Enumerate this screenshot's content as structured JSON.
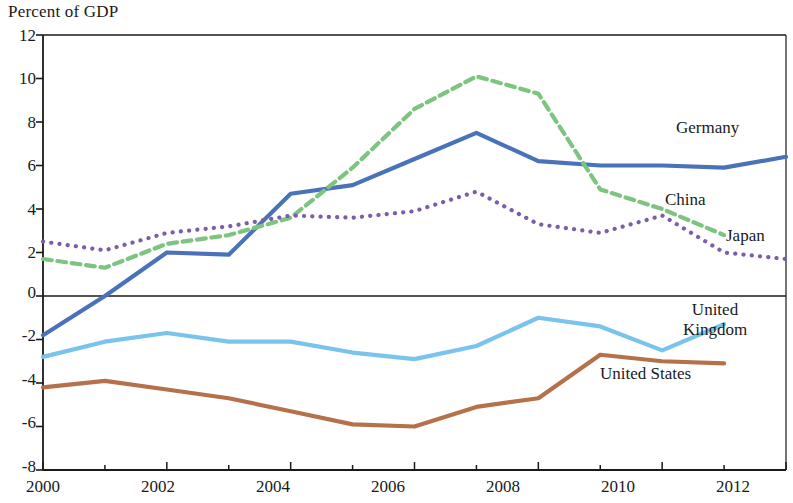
{
  "chart_data": {
    "type": "line",
    "title": "Percent of GDP",
    "xlabel": "",
    "ylabel": "Percent of GDP",
    "x": [
      2000,
      2001,
      2002,
      2003,
      2004,
      2005,
      2006,
      2007,
      2008,
      2009,
      2010,
      2011,
      2012
    ],
    "xlim": [
      2000,
      2012
    ],
    "ylim": [
      -8,
      12
    ],
    "ytick_labels": [
      "12",
      "10",
      "8",
      "6",
      "4",
      "2",
      "0",
      "-2",
      "-4",
      "-6",
      "-8"
    ],
    "yticks": [
      12,
      10,
      8,
      6,
      4,
      2,
      0,
      -2,
      -4,
      -6,
      -8
    ],
    "xtick_labels": [
      "2000",
      "2002",
      "2004",
      "2006",
      "2008",
      "2010",
      "2012"
    ],
    "xticks": [
      2000,
      2002,
      2004,
      2006,
      2008,
      2010,
      2012
    ],
    "xminor_ticks": [
      2001,
      2003,
      2005,
      2007,
      2009,
      2011
    ],
    "grid": false,
    "zero_line": true,
    "legend_position": "inline-right",
    "series": [
      {
        "name": "Germany",
        "color": "#4a72b8",
        "style": "solid",
        "x": [
          2000,
          2001,
          2002,
          2003,
          2004,
          2005,
          2006,
          2007,
          2008,
          2009,
          2010,
          2011,
          2012
        ],
        "values": [
          -1.8,
          0.0,
          2.0,
          1.9,
          4.7,
          5.1,
          6.3,
          7.5,
          6.2,
          6.0,
          6.0,
          5.9,
          6.4
        ]
      },
      {
        "name": "China",
        "color": "#7cc47f",
        "style": "dashed",
        "x": [
          2000,
          2001,
          2002,
          2003,
          2004,
          2005,
          2006,
          2007,
          2008,
          2009,
          2010,
          2011
        ],
        "values": [
          1.7,
          1.3,
          2.4,
          2.8,
          3.6,
          5.9,
          8.6,
          10.1,
          9.3,
          4.9,
          4.0,
          2.8
        ]
      },
      {
        "name": "Japan",
        "color": "#7b5ea7",
        "style": "dotted",
        "x": [
          2000,
          2001,
          2002,
          2003,
          2004,
          2005,
          2006,
          2007,
          2008,
          2009,
          2010,
          2011,
          2012
        ],
        "values": [
          2.5,
          2.1,
          2.9,
          3.2,
          3.7,
          3.6,
          3.9,
          4.8,
          3.3,
          2.9,
          3.7,
          2.0,
          1.7
        ]
      },
      {
        "name": "United Kingdom",
        "color": "#79c3ec",
        "style": "solid",
        "x": [
          2000,
          2001,
          2002,
          2003,
          2004,
          2005,
          2006,
          2007,
          2008,
          2009,
          2010,
          2011
        ],
        "values": [
          -2.8,
          -2.1,
          -1.7,
          -2.1,
          -2.1,
          -2.6,
          -2.9,
          -2.3,
          -1.0,
          -1.4,
          -2.5,
          -1.3
        ]
      },
      {
        "name": "United States",
        "color": "#b5714a",
        "style": "solid",
        "x": [
          2000,
          2001,
          2002,
          2003,
          2004,
          2005,
          2006,
          2007,
          2008,
          2009,
          2010,
          2011
        ],
        "values": [
          -4.2,
          -3.9,
          -4.3,
          -4.7,
          -5.3,
          -5.9,
          -6.0,
          -5.1,
          -4.7,
          -2.7,
          -3.0,
          -3.1
        ]
      }
    ],
    "annotations": [
      {
        "text": "Germany",
        "series": "Germany"
      },
      {
        "text": "China",
        "series": "China"
      },
      {
        "text": "Japan",
        "series": "Japan"
      },
      {
        "text": "United\nKingdom",
        "line1": "United",
        "line2": "Kingdom",
        "series": "United Kingdom"
      },
      {
        "text": "United States",
        "series": "United States"
      }
    ]
  },
  "labels": {
    "germany": "Germany",
    "china": "China",
    "japan": "Japan",
    "uk_line1": "United",
    "uk_line2": "Kingdom",
    "us": "United States"
  },
  "yticks": {
    "t0": "12",
    "t1": "10",
    "t2": "8",
    "t3": "6",
    "t4": "4",
    "t5": "2",
    "t6": "0",
    "t7": "-2",
    "t8": "-4",
    "t9": "-6",
    "t10": "-8"
  },
  "xticks": {
    "t0": "2000",
    "t1": "2002",
    "t2": "2004",
    "t3": "2006",
    "t4": "2008",
    "t5": "2010",
    "t6": "2012"
  }
}
